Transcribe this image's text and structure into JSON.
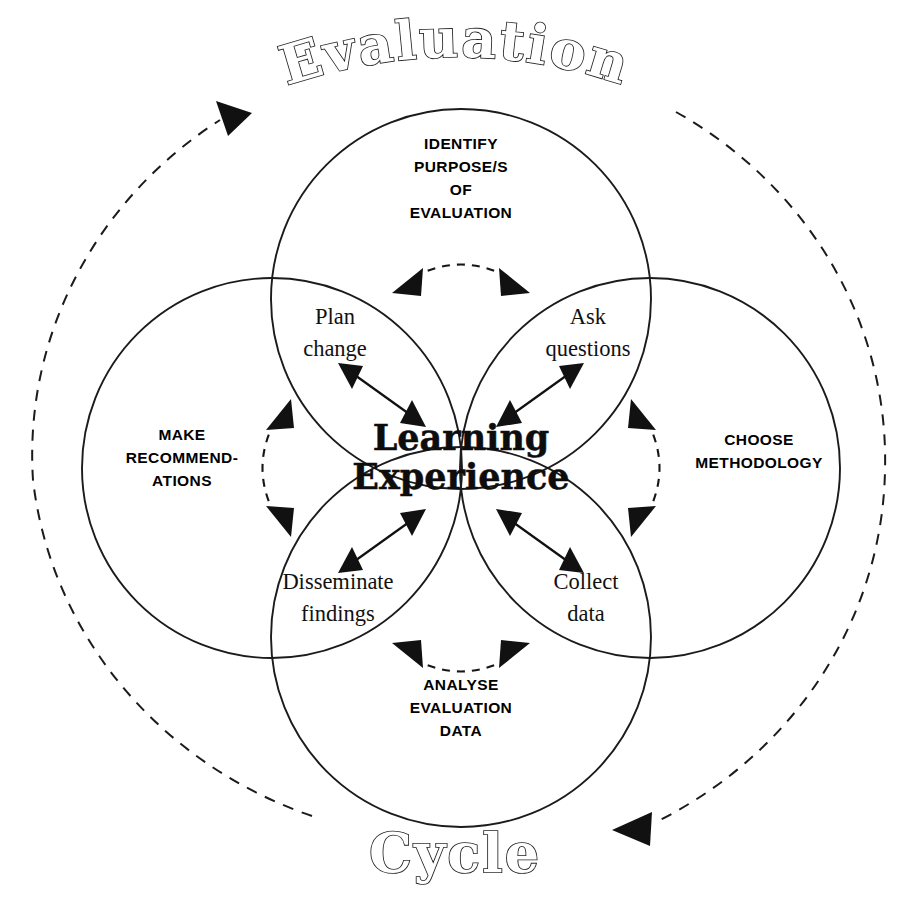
{
  "figure": {
    "arc_titles": {
      "top": "Evaluation",
      "bottom": "Cycle"
    },
    "center": {
      "line1": "Learning",
      "line2": "Experience"
    },
    "outer_phases": [
      {
        "position": "top",
        "lines": [
          "IDENTIFY",
          "PURPOSE/S",
          "OF",
          "EVALUATION"
        ]
      },
      {
        "position": "right",
        "lines": [
          "CHOOSE",
          "METHODOLOGY"
        ]
      },
      {
        "position": "bottom",
        "lines": [
          "ANALYSE",
          "EVALUATION",
          "DATA"
        ]
      },
      {
        "position": "left",
        "lines": [
          "MAKE",
          "RECOMMEND-",
          "ATIONS"
        ]
      }
    ],
    "inner_petals": [
      {
        "position": "top-left",
        "lines": [
          "Plan",
          "change"
        ]
      },
      {
        "position": "top-right",
        "lines": [
          "Ask",
          "questions"
        ]
      },
      {
        "position": "bottom-right",
        "lines": [
          "Collect",
          "data"
        ]
      },
      {
        "position": "bottom-left",
        "lines": [
          "Disseminate",
          "findings"
        ]
      }
    ],
    "colors": {
      "ink": "#1b1b1b",
      "background": "#ffffff",
      "outline_fill": "#ffffff"
    },
    "connectors": {
      "outer_cycle_direction": "clockwise",
      "outer_cycle_style": "dashed",
      "petal_link_style": "dashed double-headed arc",
      "center_link_style": "solid double-headed arrow"
    }
  }
}
